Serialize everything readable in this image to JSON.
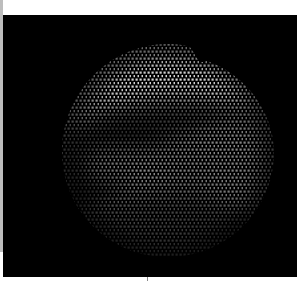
{
  "image": {
    "description": "Fiber-optic endoscope view: circular field of view with honeycomb fiber-bundle pattern on black background",
    "field_of_view": {
      "shape": "circle",
      "center_x": 168,
      "center_y": 150,
      "radius": 106,
      "notch": "top-right edge indentation"
    },
    "fiber_pattern": {
      "type": "hexagonal",
      "pitch_px": 4
    },
    "colors": {
      "background": "#000000",
      "margin": "#ffffff",
      "left_strip": "#bdbdbd",
      "highlight": "#d9d9d9",
      "midtone": "#6e6e6e",
      "shadow": "#1e1e1e"
    }
  }
}
